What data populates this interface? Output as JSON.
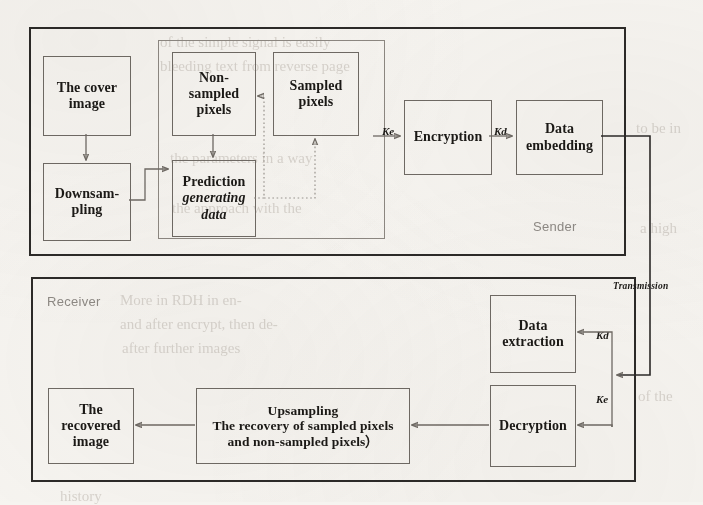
{
  "figure": {
    "type": "block-diagram",
    "zones": [
      {
        "id": "sender",
        "label": "Sender"
      },
      {
        "id": "receiver",
        "label": "Receiver"
      }
    ],
    "sender_nodes": [
      {
        "id": "cover-image",
        "lines": [
          "The cover",
          "image"
        ]
      },
      {
        "id": "downsampling",
        "lines": [
          "Downsam-",
          "pling"
        ]
      },
      {
        "id": "non-sampled-pixels",
        "lines": [
          "Non-",
          "sampled",
          "pixels"
        ]
      },
      {
        "id": "sampled-pixels",
        "lines": [
          "Sampled",
          "pixels"
        ]
      },
      {
        "id": "prediction",
        "lines": [
          "Prediction",
          "generating",
          "data"
        ],
        "italic_lines": [
          1,
          2
        ]
      },
      {
        "id": "encryption",
        "lines": [
          "Encryption"
        ]
      },
      {
        "id": "data-embedding",
        "lines": [
          "Data",
          "embedding"
        ]
      }
    ],
    "receiver_nodes": [
      {
        "id": "data-extraction",
        "lines": [
          "Data",
          "extraction"
        ]
      },
      {
        "id": "decryption",
        "lines": [
          "Decryption"
        ]
      },
      {
        "id": "upsampling",
        "lines": [
          "Upsampling",
          "The recovery of sampled pixels",
          "and non-sampled pixels）"
        ]
      },
      {
        "id": "recovered-image",
        "lines": [
          "The",
          "recovered",
          "image"
        ]
      }
    ],
    "edge_labels": {
      "ke_sender": "Ke",
      "kd_sender": "Kd",
      "kd_receiver": "Kd",
      "ke_receiver": "Ke",
      "transmission": "Transmission"
    },
    "colors": {
      "frame_stroke": "#2c2a28",
      "node_stroke": "#6f6a64",
      "inner_frame_stroke": "#8d8882",
      "wire": "#6f6a64",
      "dotted_wire": "#9a958f",
      "zone_label": "#8e8a85",
      "text": "#1b1916",
      "page_background": "#f6f4f0"
    }
  },
  "ghost_text": [
    "of the simple signal is easily",
    "bleeding text from reverse page",
    "the parameters in a way",
    "the approach with the",
    "More in RDH in en-",
    "and after encrypt, then de-",
    "after further images",
    "to be in",
    "a high",
    "of the",
    "history"
  ]
}
